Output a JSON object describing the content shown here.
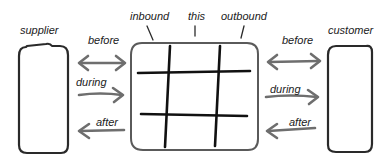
{
  "diagram": {
    "type": "hand-drawn service-context diagram",
    "colors": {
      "box_stroke": "#2a2a2a",
      "grid_stroke": "#111111",
      "arrow_stroke": "#6e6e6e",
      "text": "#1a1a1a",
      "background": "#ffffff"
    },
    "nodes": {
      "supplier": {
        "label": "supplier"
      },
      "customer": {
        "label": "customer"
      },
      "center": {
        "grid": "3x3",
        "top_labels": [
          "inbound",
          "this",
          "outbound"
        ]
      }
    },
    "left_arrows": [
      {
        "label": "before",
        "direction": "both"
      },
      {
        "label": "during",
        "direction": "right"
      },
      {
        "label": "after",
        "direction": "left"
      }
    ],
    "right_arrows": [
      {
        "label": "before",
        "direction": "both"
      },
      {
        "label": "during",
        "direction": "right"
      },
      {
        "label": "after",
        "direction": "left"
      }
    ]
  }
}
